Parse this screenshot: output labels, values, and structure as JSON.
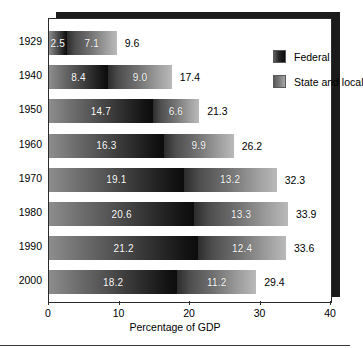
{
  "chart_data": {
    "type": "bar",
    "orientation": "horizontal",
    "stacked": true,
    "title": "",
    "xlabel": "Percentage of GDP",
    "ylabel": "",
    "xlim": [
      0,
      40
    ],
    "xticks": [
      0,
      10,
      20,
      30,
      40
    ],
    "xtick_labels": [
      "0",
      "10",
      "20",
      "30",
      "40"
    ],
    "grid": false,
    "legend_position": "top-right",
    "categories": [
      "1929",
      "1940",
      "1950",
      "1960",
      "1970",
      "1980",
      "1990",
      "2000"
    ],
    "series": [
      {
        "name": "Federal",
        "values": [
          2.5,
          8.4,
          14.7,
          16.3,
          19.1,
          20.6,
          21.2,
          18.2
        ],
        "labels": [
          "2.5",
          "8.4",
          "14.7",
          "16.3",
          "19.1",
          "20.6",
          "21.2",
          "18.2"
        ],
        "color": "#2a2a2a"
      },
      {
        "name": "State and local",
        "values": [
          7.1,
          9.0,
          6.6,
          9.9,
          13.2,
          13.3,
          12.4,
          11.2
        ],
        "labels": [
          "7.1",
          "9.0",
          "6.6",
          "9.9",
          "13.2",
          "13.3",
          "12.4",
          "11.2"
        ],
        "color": "#8a8a8a"
      }
    ],
    "totals": [
      9.6,
      17.4,
      21.3,
      26.2,
      32.3,
      33.9,
      33.6,
      29.4
    ],
    "total_labels": [
      "9.6",
      "17.4",
      "21.3",
      "26.2",
      "32.3",
      "33.9",
      "33.6",
      "29.4"
    ]
  },
  "legend": {
    "items": [
      {
        "label": "Federal",
        "swatch": "swatch-federal"
      },
      {
        "label": "State and local",
        "swatch": "swatch-state"
      }
    ]
  },
  "axis": {
    "x_title": "Percentage of GDP"
  }
}
